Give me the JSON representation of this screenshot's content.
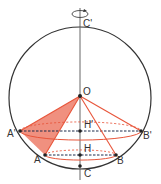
{
  "diagram": {
    "type": "geometry-sphere-inscribed-cones",
    "colors": {
      "circle": "#333333",
      "axis": "#555555",
      "cone_edge": "#e8553a",
      "cone_fill": "#e8553a",
      "dashed_chord": "#1a2a4a",
      "point": "#222222"
    },
    "labels": {
      "c_prime": "C'",
      "o": "O",
      "h_prime": "H'",
      "a_prime": "A'",
      "b_prime": "B'",
      "h": "H",
      "a": "A",
      "b": "B",
      "c": "C"
    },
    "icons": {
      "rotation": "rotation-arrow-icon"
    }
  }
}
